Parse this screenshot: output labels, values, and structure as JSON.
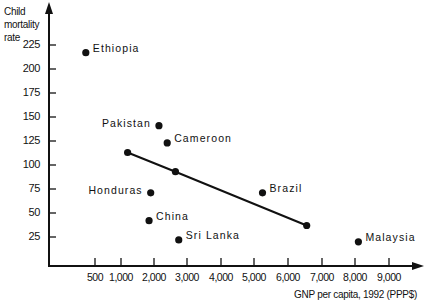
{
  "chart_data": {
    "type": "scatter",
    "title": "",
    "xlabel": "GNP per capita, 1992 (PPP$)",
    "ylabel": "Child mortality rate",
    "x_ticks": [
      "500",
      "1,000",
      "2,000",
      "3,000",
      "4,000",
      "5,000",
      "6,000",
      "7,000",
      "8,000",
      "9,000"
    ],
    "y_ticks": [
      "25",
      "50",
      "75",
      "100",
      "125",
      "150",
      "175",
      "200",
      "225"
    ],
    "ylim": [
      0,
      240
    ],
    "xlim": [
      0,
      10000
    ],
    "grid": false,
    "legend": "none",
    "points": [
      {
        "label": "Ethiopia",
        "x": 400,
        "y": 217
      },
      {
        "label": "Pakistan",
        "x": 2150,
        "y": 141
      },
      {
        "label": "Cameroon",
        "x": 2400,
        "y": 123
      },
      {
        "label": "Honduras",
        "x": 1900,
        "y": 71
      },
      {
        "label": "China",
        "x": 1850,
        "y": 42
      },
      {
        "label": "Sri Lanka",
        "x": 2750,
        "y": 22
      },
      {
        "label": "Brazil",
        "x": 5250,
        "y": 71
      },
      {
        "label": "Malaysia",
        "x": 8100,
        "y": 20
      }
    ],
    "trend_line": [
      {
        "x": 1200,
        "y": 113
      },
      {
        "x": 2650,
        "y": 93
      },
      {
        "x": 6550,
        "y": 37
      }
    ]
  },
  "labels": {
    "ylabel_lines": [
      "Child",
      "mortality",
      "rate"
    ],
    "xlabel": "GNP per capita, 1992 (PPP$)"
  }
}
